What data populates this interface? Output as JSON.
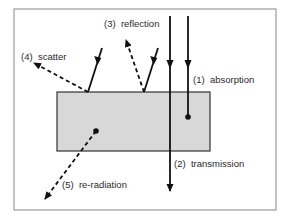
{
  "diagram": {
    "type": "radiation-matter-interactions",
    "frame": {
      "x": 14,
      "y": 9,
      "w": 262,
      "h": 201,
      "stroke": "#9a9a9a"
    },
    "medium": {
      "x": 57,
      "y": 92,
      "w": 153,
      "h": 59,
      "fill": "#d8d8d8",
      "stroke": "#333333"
    },
    "labels": {
      "absorption": "(1)  absorption",
      "transmission": "(2)  transmission",
      "reflection": "(3)  reflection",
      "scatter": "(4)  scatter",
      "reradiation": "(5)  re-radiation"
    },
    "arrows": [
      {
        "name": "absorption",
        "style": "solid",
        "from": [
          188,
          16
        ],
        "to": [
          188,
          117
        ],
        "ends_in_dot": true
      },
      {
        "name": "transmission",
        "style": "solid",
        "from": [
          170,
          16
        ],
        "to": [
          170,
          191
        ]
      },
      {
        "name": "reflection-incident",
        "style": "solid",
        "from": [
          158,
          48
        ],
        "to": [
          144,
          92
        ]
      },
      {
        "name": "reflection-out",
        "style": "dashed",
        "from": [
          144,
          92
        ],
        "to": [
          125,
          38
        ]
      },
      {
        "name": "scatter-incident",
        "style": "solid",
        "from": [
          102,
          48
        ],
        "to": [
          88,
          92
        ]
      },
      {
        "name": "scatter-out",
        "style": "dashed",
        "from": [
          88,
          92
        ],
        "to": [
          33,
          62
        ]
      },
      {
        "name": "reradiation-out",
        "style": "dashed",
        "from": [
          96,
          131
        ],
        "to": [
          44,
          200
        ],
        "starts_at_dot": true
      }
    ]
  }
}
